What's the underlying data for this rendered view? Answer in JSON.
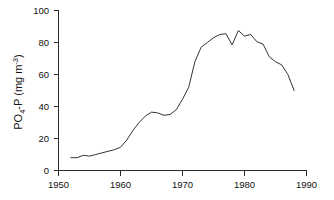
{
  "chart_data": {
    "type": "line",
    "title": "",
    "subtitle": "",
    "xlabel": "",
    "ylabel": "PO4-P (mg m-3)",
    "ylabel_parts": {
      "lead": "PO",
      "sub": "4",
      "mid": "-P  (mg m",
      "sup": "-3",
      "tail": ")"
    },
    "xlim": [
      1950,
      1990
    ],
    "ylim": [
      0,
      100
    ],
    "xticks": [
      1950,
      1960,
      1970,
      1980,
      1990
    ],
    "yticks": [
      0,
      20,
      40,
      60,
      80,
      100
    ],
    "xtick_labels": [
      "1950",
      "1960",
      "1970",
      "1980",
      "1990"
    ],
    "ytick_labels": [
      "0",
      "20",
      "40",
      "60",
      "80",
      "100"
    ],
    "grid": false,
    "legend": "none",
    "line_color": "#333333",
    "series": [
      {
        "name": "PO4-P concentration",
        "x": [
          1952,
          1953,
          1954,
          1955,
          1956,
          1957,
          1958,
          1959,
          1960,
          1961,
          1962,
          1963,
          1964,
          1965,
          1966,
          1967,
          1968,
          1969,
          1970,
          1971,
          1972,
          1973,
          1974,
          1975,
          1976,
          1977,
          1978,
          1979,
          1980,
          1981,
          1982,
          1983,
          1984,
          1985,
          1986,
          1987,
          1988
        ],
        "values": [
          8,
          8,
          9.5,
          9,
          10,
          11,
          12,
          13,
          14.5,
          19,
          25,
          30,
          34,
          36.5,
          36,
          34.5,
          35,
          38,
          44.5,
          52,
          68,
          77,
          80,
          83,
          85,
          85.5,
          78.5,
          87.5,
          84,
          85,
          80.5,
          79,
          71,
          68,
          66,
          60,
          50
        ]
      }
    ]
  },
  "axis": {
    "x_axis_name": "year-axis",
    "y_axis_name": "concentration-axis"
  }
}
